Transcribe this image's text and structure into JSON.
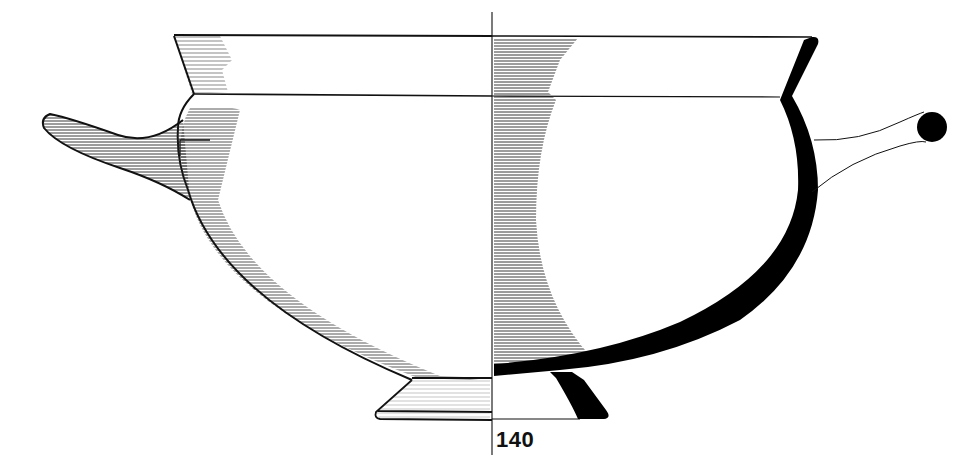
{
  "figure": {
    "number_label": "140",
    "colors": {
      "ink": "#111111",
      "section_fill": "#000000",
      "background": "#ffffff"
    }
  }
}
